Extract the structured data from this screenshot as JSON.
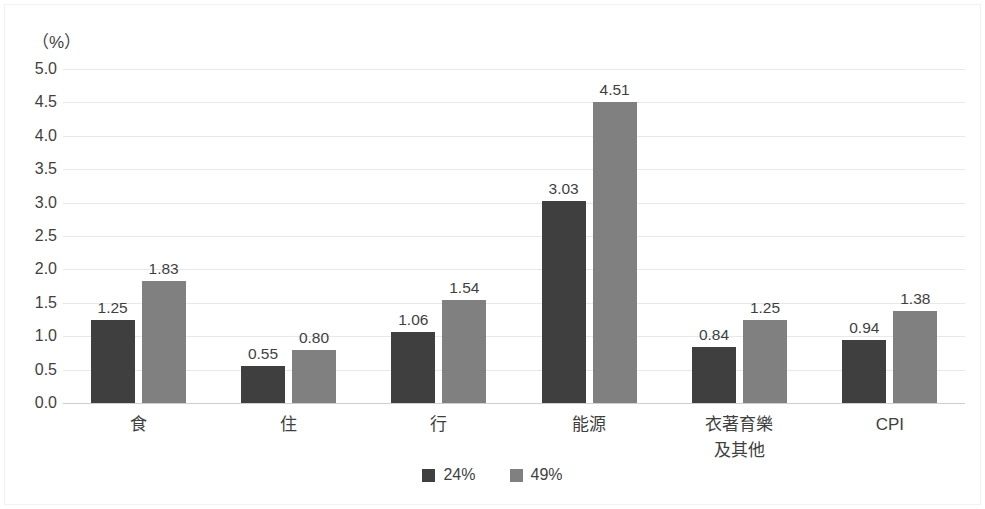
{
  "chart_data": {
    "type": "bar",
    "title": "",
    "subtitle": "",
    "xlabel": "",
    "ylabel": "",
    "unit_label": "（%）",
    "ylim": [
      0.0,
      5.0
    ],
    "ytick_step": 0.5,
    "yticks": [
      "5.0",
      "4.5",
      "4.0",
      "3.5",
      "3.0",
      "2.5",
      "2.0",
      "1.5",
      "1.0",
      "0.5",
      "0.0"
    ],
    "ytick_values": [
      5.0,
      4.5,
      4.0,
      3.5,
      3.0,
      2.5,
      2.0,
      1.5,
      1.0,
      0.5,
      0.0
    ],
    "grid": true,
    "grid_axis": "y",
    "legend_position": "bottom-center",
    "categories": [
      "食",
      "住",
      "行",
      "能源",
      "衣著育樂\n及其他",
      "CPI"
    ],
    "series": [
      {
        "name": "24%",
        "color": "#3f3f3f",
        "values": [
          1.25,
          0.55,
          1.06,
          3.03,
          0.84,
          0.94
        ],
        "labels": [
          "1.25",
          "0.55",
          "1.06",
          "3.03",
          "0.84",
          "0.94"
        ]
      },
      {
        "name": "49%",
        "color": "#808080",
        "values": [
          1.83,
          0.8,
          1.54,
          4.51,
          1.25,
          1.38
        ],
        "labels": [
          "1.83",
          "0.80",
          "1.54",
          "4.51",
          "1.25",
          "1.38"
        ]
      }
    ]
  },
  "colors": {
    "series_dark": "#3f3f3f",
    "series_light": "#808080",
    "gridline": "#e8e8e8",
    "baseline": "#cfcfcf",
    "text": "#3f3f3f",
    "background": "#ffffff"
  }
}
